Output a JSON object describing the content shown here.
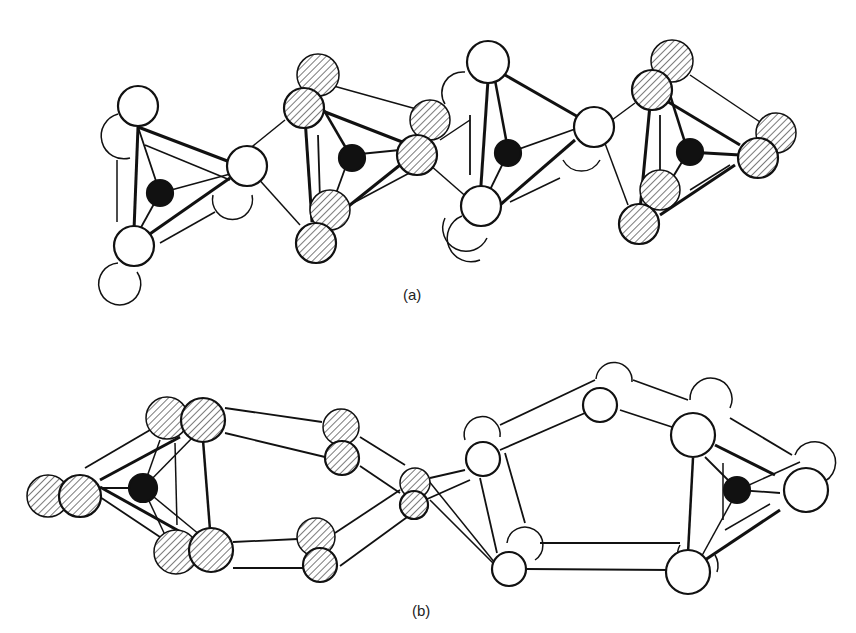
{
  "figure": {
    "panels": [
      {
        "id": "a",
        "label": "(a)",
        "description": "Chain of edge-sharing tetrahedra, each with a black central atom"
      },
      {
        "id": "b",
        "label": "(b)",
        "description": "Ring-like linkage of polyhedra with hatched and open atoms"
      }
    ],
    "legend_atoms": {
      "central_atom": "black filled circle",
      "hatched_atom": "hatched circle",
      "open_atom": "open circle"
    },
    "colors": {
      "stroke": "#111111",
      "fill_open": "#ffffff",
      "fill_central": "#111111",
      "hatch": "#333333"
    }
  }
}
